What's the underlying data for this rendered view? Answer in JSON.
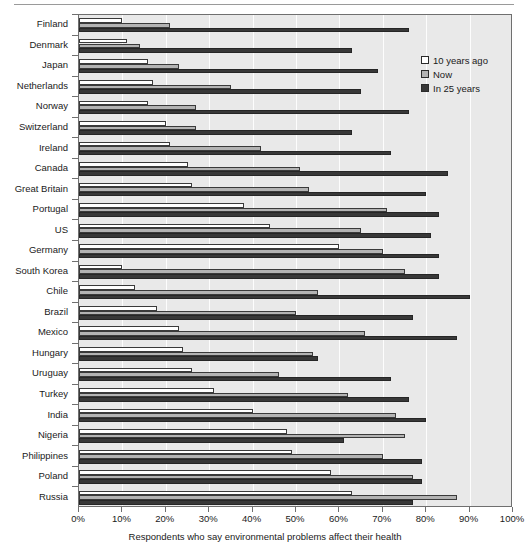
{
  "chart_data": {
    "type": "bar",
    "orientation": "horizontal",
    "title": "",
    "xlabel": "Respondents who say environmental problems affect their health",
    "ylabel": "",
    "xlim": [
      0,
      100
    ],
    "xunit": "%",
    "xticks": [
      0,
      10,
      20,
      30,
      40,
      50,
      60,
      70,
      80,
      90,
      100
    ],
    "xticklabels": [
      "0%",
      "10%",
      "20%",
      "30%",
      "40%",
      "50%",
      "60%",
      "70%",
      "80%",
      "90%",
      "100%"
    ],
    "grid": "vertical",
    "legend_position": "top-right",
    "categories": [
      "Finland",
      "Denmark",
      "Japan",
      "Netherlands",
      "Norway",
      "Switzerland",
      "Ireland",
      "Canada",
      "Great Britain",
      "Portugal",
      "US",
      "Germany",
      "South Korea",
      "Chile",
      "Brazil",
      "Mexico",
      "Hungary",
      "Uruguay",
      "Turkey",
      "India",
      "Nigeria",
      "Philippines",
      "Poland",
      "Russia"
    ],
    "series": [
      {
        "name": "10 years ago",
        "color": "#ffffff",
        "values": [
          10,
          11,
          16,
          17,
          16,
          20,
          21,
          25,
          26,
          38,
          44,
          60,
          10,
          13,
          18,
          23,
          24,
          26,
          31,
          40,
          48,
          49,
          58,
          63
        ]
      },
      {
        "name": "Now",
        "color": "#b3b3b3",
        "values": [
          21,
          14,
          23,
          35,
          27,
          27,
          42,
          51,
          53,
          71,
          65,
          70,
          75,
          55,
          50,
          66,
          54,
          46,
          62,
          73,
          75,
          70,
          77,
          87
        ]
      },
      {
        "name": "In 25 years",
        "color": "#383838",
        "values": [
          76,
          63,
          69,
          65,
          76,
          63,
          72,
          85,
          80,
          83,
          81,
          83,
          83,
          90,
          77,
          87,
          55,
          72,
          76,
          80,
          61,
          79,
          79,
          77
        ]
      }
    ]
  },
  "legend": {
    "entries": [
      {
        "label": "10 years ago",
        "swatch": "past"
      },
      {
        "label": "Now",
        "swatch": "now"
      },
      {
        "label": "In 25 years",
        "swatch": "future"
      }
    ]
  }
}
